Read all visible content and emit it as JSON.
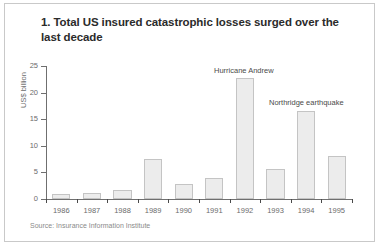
{
  "chart_data": {
    "type": "bar",
    "title": "1. Total US insured catastrophic losses surged over the last decade",
    "xlabel": "",
    "ylabel": "US$ billion",
    "ylim": [
      0,
      25
    ],
    "yticks": [
      0,
      5,
      10,
      15,
      20,
      25
    ],
    "grid": false,
    "legend": "none",
    "categories": [
      "1986",
      "1987",
      "1988",
      "1989",
      "1990",
      "1991",
      "1992",
      "1993",
      "1994",
      "1995"
    ],
    "values": [
      1.0,
      1.1,
      1.6,
      7.5,
      2.8,
      4.0,
      22.7,
      5.6,
      16.5,
      8.0
    ],
    "annotations": [
      {
        "text": "Hurricane Andrew",
        "category": "1992"
      },
      {
        "text": "Northridge earthquake",
        "category": "1994"
      }
    ],
    "source": "Source: Insurance Information Institute"
  },
  "colors": {
    "bar_fill": "#ececec",
    "bar_border": "#c4c4c4",
    "axis": "#6f6f6f",
    "title_text": "#2b2b2b",
    "tick_text": "#6b6b6b",
    "source_text": "#8a8a8a",
    "panel_border": "#c9c9c9",
    "background": "#ffffff"
  }
}
